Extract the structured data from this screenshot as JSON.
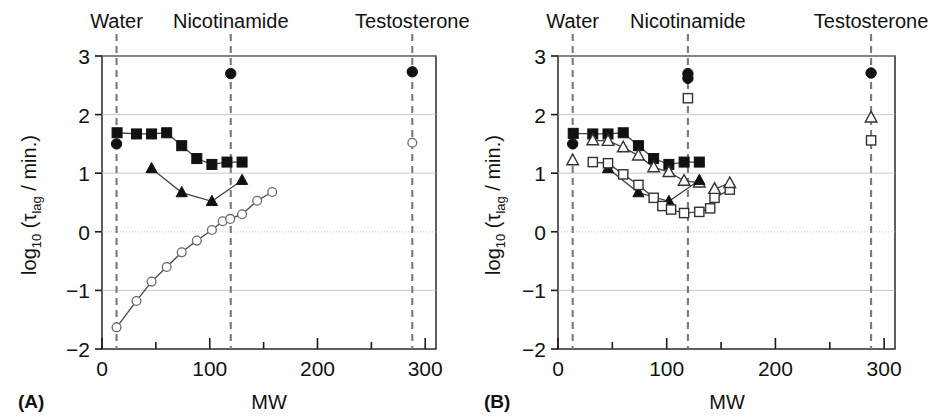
{
  "figure": {
    "panels": [
      {
        "id": "A",
        "label": "(A)",
        "xlabel": "MW",
        "ylabel_main": "log",
        "ylabel_sub": "10",
        "ylabel_rest_open": " (τ",
        "ylabel_tau_sub": "lag",
        "ylabel_rest_close": " / min.)",
        "xticks": [
          "0",
          "100",
          "200",
          "300"
        ],
        "yticks": [
          "3",
          "2",
          "1",
          "0",
          "−1",
          "−2"
        ],
        "solvent_markers": [
          {
            "name": "Water",
            "label": "Water",
            "mw": 13.5
          },
          {
            "name": "Nicotinamide",
            "label": "Nicotinamide",
            "mw": 119.5
          },
          {
            "name": "Testosterone",
            "label": "Testosterone",
            "mw": 288.0
          }
        ]
      },
      {
        "id": "B",
        "label": "(B)",
        "xlabel": "MW",
        "ylabel_main": "log",
        "ylabel_sub": "10",
        "ylabel_rest_open": " (τ",
        "ylabel_tau_sub": "lag",
        "ylabel_rest_close": " / min.)",
        "xticks": [
          "0",
          "100",
          "200",
          "300"
        ],
        "yticks": [
          "3",
          "2",
          "1",
          "0",
          "−1",
          "−2"
        ],
        "solvent_markers": [
          {
            "name": "Water",
            "label": "Water",
            "mw": 13.5
          },
          {
            "name": "Nicotinamide",
            "label": "Nicotinamide",
            "mw": 119.5
          },
          {
            "name": "Testosterone",
            "label": "Testosterone",
            "mw": 288.0
          }
        ]
      }
    ],
    "colors": {
      "axis": "#1a1a1a",
      "grid": "#bfbfbf",
      "dashed_guide": "#7a7a7a",
      "filled_marker": "#111111",
      "open_marker_stroke": "#333333",
      "open_marker_fill": "#ffffff",
      "open_circle_stroke": "#6a6a6a",
      "connector": "#444444"
    }
  },
  "chart_data": [
    {
      "type": "scatter",
      "panel": "A",
      "title": "(A)",
      "xlabel": "MW",
      "ylabel": "log10 (tau_lag / min.)",
      "xlim": [
        0,
        310
      ],
      "ylim": [
        -2,
        3
      ],
      "xticks": [
        0,
        100,
        200,
        300
      ],
      "yticks": [
        -2,
        -1,
        0,
        1,
        2,
        3
      ],
      "grid": true,
      "legend": "none",
      "vertical_reference_lines": [
        {
          "label": "Water",
          "x": 13.5
        },
        {
          "label": "Nicotinamide",
          "x": 119.5
        },
        {
          "label": "Testosterone",
          "x": 288.0
        }
      ],
      "series": [
        {
          "name": "filled-square",
          "marker": "filled-square",
          "connected": true,
          "points": [
            {
              "x": 14,
              "y": 1.69
            },
            {
              "x": 32,
              "y": 1.67
            },
            {
              "x": 46,
              "y": 1.67
            },
            {
              "x": 60,
              "y": 1.69
            },
            {
              "x": 74,
              "y": 1.47
            },
            {
              "x": 88,
              "y": 1.25
            },
            {
              "x": 102,
              "y": 1.15
            },
            {
              "x": 116,
              "y": 1.19
            },
            {
              "x": 130,
              "y": 1.19
            }
          ]
        },
        {
          "name": "filled-triangle",
          "marker": "filled-triangle",
          "connected": true,
          "points": [
            {
              "x": 46,
              "y": 1.08
            },
            {
              "x": 74,
              "y": 0.67
            },
            {
              "x": 102,
              "y": 0.52
            },
            {
              "x": 130,
              "y": 0.88
            }
          ]
        },
        {
          "name": "filled-circle",
          "marker": "filled-circle",
          "connected": false,
          "points": [
            {
              "x": 13.5,
              "y": 1.5
            },
            {
              "x": 119.5,
              "y": 2.7
            },
            {
              "x": 288.0,
              "y": 2.73
            }
          ]
        },
        {
          "name": "open-circle",
          "marker": "open-circle",
          "connected": true,
          "points": [
            {
              "x": 13.5,
              "y": -1.63
            },
            {
              "x": 32,
              "y": -1.18
            },
            {
              "x": 46,
              "y": -0.85
            },
            {
              "x": 60,
              "y": -0.6
            },
            {
              "x": 74,
              "y": -0.35
            },
            {
              "x": 88,
              "y": -0.15
            },
            {
              "x": 102,
              "y": 0.03
            },
            {
              "x": 112,
              "y": 0.18
            },
            {
              "x": 119,
              "y": 0.22
            },
            {
              "x": 130,
              "y": 0.3
            },
            {
              "x": 144,
              "y": 0.53
            },
            {
              "x": 158,
              "y": 0.68
            }
          ]
        },
        {
          "name": "open-circle-testosterone",
          "marker": "open-circle",
          "connected": false,
          "points": [
            {
              "x": 288.0,
              "y": 1.52
            }
          ]
        }
      ]
    },
    {
      "type": "scatter",
      "panel": "B",
      "title": "(B)",
      "xlabel": "MW",
      "ylabel": "log10 (tau_lag / min.)",
      "xlim": [
        0,
        310
      ],
      "ylim": [
        -2,
        3
      ],
      "xticks": [
        0,
        100,
        200,
        300
      ],
      "yticks": [
        -2,
        -1,
        0,
        1,
        2,
        3
      ],
      "grid": true,
      "legend": "none",
      "vertical_reference_lines": [
        {
          "label": "Water",
          "x": 13.5
        },
        {
          "label": "Nicotinamide",
          "x": 119.5
        },
        {
          "label": "Testosterone",
          "x": 288.0
        }
      ],
      "series": [
        {
          "name": "filled-square",
          "marker": "filled-square",
          "connected": true,
          "points": [
            {
              "x": 14,
              "y": 1.68
            },
            {
              "x": 32,
              "y": 1.67
            },
            {
              "x": 46,
              "y": 1.67
            },
            {
              "x": 60,
              "y": 1.69
            },
            {
              "x": 74,
              "y": 1.47
            },
            {
              "x": 88,
              "y": 1.25
            },
            {
              "x": 102,
              "y": 1.15
            },
            {
              "x": 116,
              "y": 1.19
            },
            {
              "x": 130,
              "y": 1.19
            }
          ]
        },
        {
          "name": "open-triangle-upper",
          "marker": "open-triangle",
          "connected": true,
          "points": [
            {
              "x": 32,
              "y": 1.56
            },
            {
              "x": 46,
              "y": 1.55
            },
            {
              "x": 60,
              "y": 1.44
            },
            {
              "x": 74,
              "y": 1.3
            },
            {
              "x": 88,
              "y": 1.1
            },
            {
              "x": 102,
              "y": 1.02
            },
            {
              "x": 116,
              "y": 0.87
            },
            {
              "x": 130,
              "y": 0.84
            }
          ]
        },
        {
          "name": "filled-triangle",
          "marker": "filled-triangle",
          "connected": true,
          "points": [
            {
              "x": 46,
              "y": 1.08
            },
            {
              "x": 74,
              "y": 0.67
            },
            {
              "x": 102,
              "y": 0.52
            },
            {
              "x": 130,
              "y": 0.88
            }
          ]
        },
        {
          "name": "open-square",
          "marker": "open-square",
          "connected": true,
          "points": [
            {
              "x": 32,
              "y": 1.19
            },
            {
              "x": 46,
              "y": 1.17
            },
            {
              "x": 60,
              "y": 0.98
            },
            {
              "x": 74,
              "y": 0.8
            },
            {
              "x": 88,
              "y": 0.58
            },
            {
              "x": 96,
              "y": 0.44
            },
            {
              "x": 104,
              "y": 0.38
            },
            {
              "x": 116,
              "y": 0.32
            },
            {
              "x": 130,
              "y": 0.34
            },
            {
              "x": 140,
              "y": 0.4
            }
          ]
        },
        {
          "name": "open-square-tail",
          "marker": "open-square",
          "connected": true,
          "points": [
            {
              "x": 144,
              "y": 0.58
            },
            {
              "x": 158,
              "y": 0.72
            }
          ]
        },
        {
          "name": "open-triangle-tail",
          "marker": "open-triangle",
          "connected": true,
          "points": [
            {
              "x": 144,
              "y": 0.73
            },
            {
              "x": 158,
              "y": 0.83
            }
          ]
        },
        {
          "name": "open-triangle-water",
          "marker": "open-triangle",
          "connected": false,
          "points": [
            {
              "x": 13.5,
              "y": 1.22
            }
          ]
        },
        {
          "name": "filled-circle",
          "marker": "filled-circle",
          "connected": false,
          "points": [
            {
              "x": 13.5,
              "y": 1.5
            },
            {
              "x": 119.5,
              "y": 2.7
            },
            {
              "x": 119.5,
              "y": 2.62
            },
            {
              "x": 288.0,
              "y": 2.71
            }
          ]
        },
        {
          "name": "open-square-refs",
          "marker": "open-square",
          "connected": false,
          "points": [
            {
              "x": 119.5,
              "y": 2.28
            },
            {
              "x": 288.0,
              "y": 1.56
            }
          ]
        },
        {
          "name": "open-triangle-refs",
          "marker": "open-triangle",
          "connected": false,
          "points": [
            {
              "x": 288.0,
              "y": 1.95
            }
          ]
        }
      ]
    }
  ]
}
